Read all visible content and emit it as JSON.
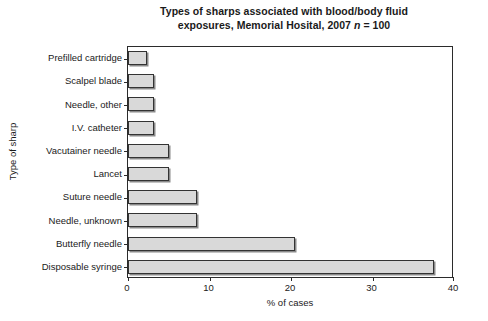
{
  "chart_data": {
    "type": "bar",
    "orientation": "horizontal",
    "title": "Types of sharps associated with blood/body fluid exposures, Memorial Hosital, 2007 n = 100",
    "title_line1": "Types of sharps associated with blood/body fluid",
    "title_line2_prefix": "exposures, Memorial Hosital, 2007 ",
    "title_line2_italic": "n",
    "title_line2_suffix": " = 100",
    "xlabel": "% of cases",
    "ylabel": "Type of sharp",
    "xlim": [
      0,
      40
    ],
    "xticks": [
      0,
      10,
      20,
      30,
      40
    ],
    "xtick_labels": [
      "0",
      "10",
      "20",
      "30",
      "40"
    ],
    "grid": false,
    "legend": "none",
    "bar_fill_color": "#d9d9d9",
    "bar_edge_color": "#333333",
    "categories": [
      "Prefilled cartridge",
      "Scalpel blade",
      "Needle, other",
      "I.V. catheter",
      "Vacutainer needle",
      "Lancet",
      "Suture needle",
      "Needle, unknown",
      "Butterfly needle",
      "Disposable syringe"
    ],
    "values": [
      2.3,
      3.2,
      3.2,
      3.2,
      5.0,
      5.0,
      8.5,
      8.5,
      20.5,
      37.5
    ]
  }
}
